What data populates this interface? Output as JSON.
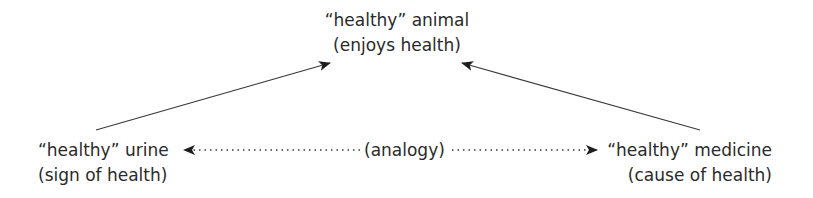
{
  "diagram": {
    "type": "concept-analogy",
    "nodes": {
      "top": {
        "label": "“healthy” animal",
        "sublabel": "(enjoys health)"
      },
      "left": {
        "label": "“healthy” urine",
        "sublabel": "(sign of health)"
      },
      "right": {
        "label": "“healthy” medicine",
        "sublabel": "(cause of health)"
      }
    },
    "edges": [
      {
        "from": "left",
        "to": "top",
        "style": "solid"
      },
      {
        "from": "right",
        "to": "top",
        "style": "solid"
      },
      {
        "from": "center",
        "to": "left",
        "style": "dotted"
      },
      {
        "from": "center",
        "to": "right",
        "style": "dotted"
      }
    ],
    "analogy_label": "(analogy)",
    "colors": {
      "text": "#2a2a2a",
      "line": "#3a3a3a",
      "background": "#ffffff"
    }
  }
}
